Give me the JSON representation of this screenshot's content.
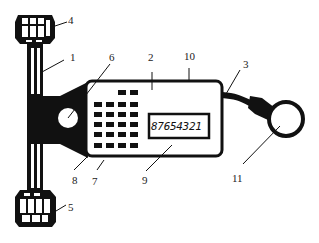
{
  "diagram": {
    "type": "mechanical device schematic (counter with handle and ring)",
    "display_reading": "87654321",
    "keypad": {
      "rows": [
        2,
        4,
        4,
        4,
        4,
        4
      ]
    },
    "callouts": [
      {
        "id": "1",
        "text": "1"
      },
      {
        "id": "2",
        "text": "2"
      },
      {
        "id": "3",
        "text": "3"
      },
      {
        "id": "4",
        "text": "4"
      },
      {
        "id": "5",
        "text": "5"
      },
      {
        "id": "6",
        "text": "6"
      },
      {
        "id": "7",
        "text": "7"
      },
      {
        "id": "8",
        "text": "8"
      },
      {
        "id": "9",
        "text": "9"
      },
      {
        "id": "10",
        "text": "10"
      },
      {
        "id": "11",
        "text": "11"
      }
    ],
    "colors": {
      "ink": "#111111",
      "background": "#ffffff"
    }
  }
}
